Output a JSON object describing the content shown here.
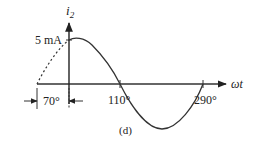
{
  "figure": {
    "caption": "(d)",
    "y_axis_label": "i",
    "y_axis_subscript": "2",
    "x_axis_label": "ωt",
    "amplitude_label": "5 mA",
    "markers": {
      "phase_offset": "70°",
      "zero_crossing_1": "110°",
      "zero_crossing_2": "290°"
    },
    "curve": {
      "type": "sine",
      "amplitude_mA": 5,
      "phase_shift_deg": 70,
      "dashed_segment": "before ωt = 0 (from −70° to 0°)",
      "solid_segment": "from 0° to 290°"
    },
    "colors": {
      "line": "#333333",
      "text": "#222222"
    }
  }
}
